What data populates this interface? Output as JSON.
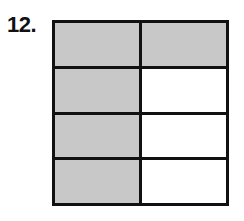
{
  "problem": {
    "number_label": "12."
  },
  "figure": {
    "rows": 4,
    "cols": 2,
    "shaded_color": "#c8c8c8",
    "unshaded_color": "#ffffff",
    "cells": [
      [
        true,
        true
      ],
      [
        true,
        false
      ],
      [
        true,
        false
      ],
      [
        true,
        false
      ]
    ],
    "shaded_count": 5,
    "total_count": 8
  }
}
